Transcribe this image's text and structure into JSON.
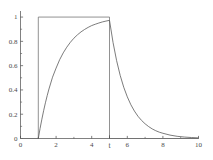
{
  "chart_data": {
    "type": "line",
    "title": "",
    "subtitle": "",
    "xlabel": "t",
    "ylabel": "",
    "xlim": [
      0,
      10
    ],
    "ylim": [
      0,
      1.05
    ],
    "grid": false,
    "legend": null,
    "x_ticks": [
      {
        "value": 0,
        "label": "0"
      },
      {
        "value": 2,
        "label": "2"
      },
      {
        "value": 4,
        "label": "4"
      },
      {
        "value": 6,
        "label": "6"
      },
      {
        "value": 8,
        "label": "8"
      },
      {
        "value": 10,
        "label": "10"
      }
    ],
    "y_ticks": [
      {
        "value": 0,
        "label": "0"
      },
      {
        "value": 0.2,
        "label": "0.2"
      },
      {
        "value": 0.4,
        "label": "0.4"
      },
      {
        "value": 0.6,
        "label": "0.6"
      },
      {
        "value": 0.8,
        "label": "0.8"
      },
      {
        "value": 1,
        "label": "1"
      }
    ],
    "x_axis_label_mark": {
      "value": 5,
      "label": "t"
    },
    "series": [
      {
        "name": "input-pulse",
        "kind": "rectangular-pulse",
        "color": "#6e6e6e",
        "amplitude": 1,
        "start": 1,
        "end": 5,
        "points": [
          [
            0,
            0
          ],
          [
            1,
            0
          ],
          [
            1,
            1
          ],
          [
            5,
            1
          ],
          [
            5,
            0
          ],
          [
            10,
            0
          ]
        ]
      },
      {
        "name": "response-curve",
        "kind": "exponential-charge-discharge",
        "color": "#5a5a5a",
        "rise_start": 1,
        "rise_end": 5,
        "peak_value": 0.97,
        "tau_rise": 1.15,
        "tau_decay": 0.95,
        "points": [
          [
            1,
            0.0
          ],
          [
            1.1,
            0.083
          ],
          [
            1.2,
            0.159
          ],
          [
            1.3,
            0.229
          ],
          [
            1.4,
            0.294
          ],
          [
            1.5,
            0.353
          ],
          [
            1.6,
            0.408
          ],
          [
            1.8,
            0.505
          ],
          [
            2.0,
            0.58
          ],
          [
            2.2,
            0.649
          ],
          [
            2.4,
            0.705
          ],
          [
            2.6,
            0.752
          ],
          [
            2.8,
            0.792
          ],
          [
            3.0,
            0.826
          ],
          [
            3.2,
            0.854
          ],
          [
            3.4,
            0.878
          ],
          [
            3.6,
            0.898
          ],
          [
            3.8,
            0.915
          ],
          [
            4.0,
            0.93
          ],
          [
            4.2,
            0.941
          ],
          [
            4.4,
            0.951
          ],
          [
            4.6,
            0.96
          ],
          [
            4.8,
            0.967
          ],
          [
            5.0,
            0.973
          ],
          [
            5.2,
            0.79
          ],
          [
            5.4,
            0.641
          ],
          [
            5.6,
            0.52
          ],
          [
            5.8,
            0.422
          ],
          [
            6.0,
            0.343
          ],
          [
            6.2,
            0.278
          ],
          [
            6.4,
            0.226
          ],
          [
            6.6,
            0.183
          ],
          [
            6.8,
            0.149
          ],
          [
            7.0,
            0.121
          ],
          [
            7.2,
            0.098
          ],
          [
            7.4,
            0.079
          ],
          [
            7.6,
            0.064
          ],
          [
            7.8,
            0.052
          ],
          [
            8.0,
            0.043
          ],
          [
            8.4,
            0.028
          ],
          [
            8.8,
            0.018
          ],
          [
            9.2,
            0.012
          ],
          [
            9.6,
            0.008
          ],
          [
            10.0,
            0.005
          ]
        ]
      }
    ]
  },
  "style": {
    "background": "#ffffff",
    "axis_color": "#4a4a4a",
    "pulse_color": "#6e6e6e",
    "curve_color": "#5a5a5a",
    "tick_color": "#4a4a4a"
  }
}
